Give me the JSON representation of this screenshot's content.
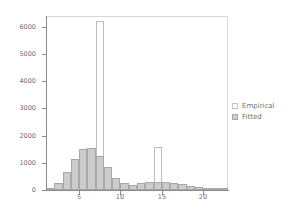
{
  "chart_data": {
    "type": "bar",
    "title": "",
    "subtitle": "",
    "xlabel": "",
    "ylabel": "",
    "xlim": [
      1,
      23
    ],
    "ylim": [
      0,
      6400
    ],
    "grid": false,
    "legend_position": "right",
    "y_ticks": [
      0,
      1000,
      2000,
      3000,
      4000,
      5000,
      6000
    ],
    "y_tick_labels": [
      "0",
      "1000",
      "2000",
      "3000",
      "4000",
      "5000",
      "6000"
    ],
    "x_ticks": [
      5,
      10,
      15,
      20
    ],
    "x_tick_labels": [
      "5",
      "10",
      "15",
      "20"
    ],
    "bin_width": 1,
    "bin_starts": [
      1,
      2,
      3,
      4,
      5,
      6,
      7,
      8,
      9,
      10,
      11,
      12,
      13,
      14,
      15,
      16,
      17,
      18,
      19,
      20,
      21,
      22
    ],
    "series": [
      {
        "name": "Empirical",
        "style": "outline",
        "color": "#ffffff",
        "edge_color": "#bdbdbd",
        "values": [
          20,
          60,
          170,
          250,
          200,
          200,
          6200,
          180,
          160,
          120,
          90,
          90,
          90,
          1600,
          110,
          120,
          100,
          80,
          50,
          40,
          25,
          10
        ]
      },
      {
        "name": "Fitted",
        "style": "filled",
        "color": "#cccccc",
        "edge_color": "#a8a8a8",
        "values": [
          70,
          270,
          660,
          1140,
          1500,
          1530,
          1240,
          830,
          440,
          240,
          200,
          250,
          290,
          310,
          290,
          270,
          210,
          160,
          110,
          70,
          40,
          20
        ]
      }
    ]
  },
  "legend": {
    "items": [
      {
        "label": "Empirical",
        "swatch": "outline-swatch"
      },
      {
        "label": "Fitted",
        "swatch": "filled-swatch"
      }
    ]
  },
  "colors": {
    "fitted_fill": "#cccccc",
    "fitted_edge": "#a8a8a8",
    "empirical_fill": "#ffffff",
    "empirical_edge": "#bdbdbd",
    "axis": "#8a8a8a",
    "tick_text": "#6e6e6e",
    "frame": "#d8d8d8",
    "background": "#ffffff"
  }
}
